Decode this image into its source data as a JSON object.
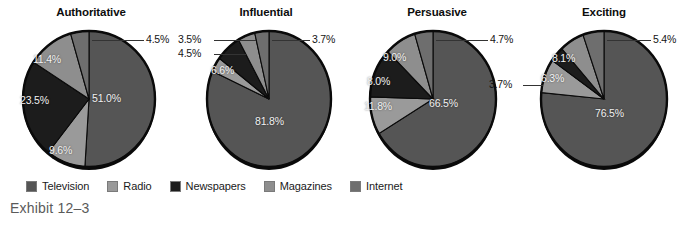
{
  "exhibit": {
    "caption": "Exhibit 12–3"
  },
  "legend": {
    "position": "bottom-left",
    "items": [
      {
        "label": "Television",
        "color": "#555555",
        "key": "television"
      },
      {
        "label": "Radio",
        "color": "#9a9a9a",
        "key": "radio"
      },
      {
        "label": "Newspapers",
        "color": "#1c1c1c",
        "key": "newspapers"
      },
      {
        "label": "Magazines",
        "color": "#8e8e8e",
        "key": "magazines"
      },
      {
        "label": "Internet",
        "color": "#6e6e6e",
        "key": "internet"
      }
    ]
  },
  "chart_data": [
    {
      "type": "pie",
      "title": "Authoritative",
      "categories": [
        "Television",
        "Radio",
        "Newspapers",
        "Magazines",
        "Internet"
      ],
      "values": [
        51.0,
        9.6,
        23.5,
        11.4,
        4.5
      ],
      "labels": [
        "51.0%",
        "9.6%",
        "23.5%",
        "11.4%",
        "4.5%"
      ],
      "colors": [
        "#555555",
        "#9a9a9a",
        "#1c1c1c",
        "#8e8e8e",
        "#6e6e6e"
      ],
      "label_placement": [
        "inside",
        "inside",
        "inside",
        "inside",
        "outside"
      ],
      "xlabel": "",
      "ylabel": "",
      "legend": "shared-bottom"
    },
    {
      "type": "pie",
      "title": "Influential",
      "categories": [
        "Television",
        "Radio",
        "Newspapers",
        "Magazines",
        "Internet"
      ],
      "values": [
        81.8,
        3.5,
        6.6,
        4.5,
        3.7
      ],
      "labels": [
        "81.8%",
        "3.5%",
        "6.6%",
        "4.5%",
        "3.7%"
      ],
      "colors": [
        "#555555",
        "#9a9a9a",
        "#1c1c1c",
        "#8e8e8e",
        "#6e6e6e"
      ],
      "label_placement": [
        "inside",
        "outside",
        "inside",
        "outside",
        "outside"
      ],
      "xlabel": "",
      "ylabel": "",
      "legend": "shared-bottom"
    },
    {
      "type": "pie",
      "title": "Persuasive",
      "categories": [
        "Television",
        "Radio",
        "Newspapers",
        "Magazines",
        "Internet"
      ],
      "values": [
        66.5,
        9.0,
        11.8,
        8.0,
        4.7
      ],
      "labels": [
        "66.5%",
        "9.0%",
        "11.8%",
        "8.0%",
        "4.7%"
      ],
      "colors": [
        "#555555",
        "#9a9a9a",
        "#1c1c1c",
        "#8e8e8e",
        "#6e6e6e"
      ],
      "label_placement": [
        "inside",
        "inside",
        "inside",
        "inside",
        "outside"
      ],
      "xlabel": "",
      "ylabel": "",
      "legend": "shared-bottom"
    },
    {
      "type": "pie",
      "title": "Exciting",
      "categories": [
        "Television",
        "Radio",
        "Newspapers",
        "Magazines",
        "Internet"
      ],
      "values": [
        76.5,
        8.1,
        3.7,
        6.3,
        5.4
      ],
      "labels": [
        "76.5%",
        "8.1%",
        "3.7%",
        "6.3%",
        "5.4%"
      ],
      "colors": [
        "#555555",
        "#9a9a9a",
        "#1c1c1c",
        "#8e8e8e",
        "#6e6e6e"
      ],
      "label_placement": [
        "inside",
        "inside",
        "outside",
        "inside",
        "outside"
      ],
      "xlabel": "",
      "ylabel": "",
      "legend": "shared-bottom"
    }
  ],
  "charts": {
    "c0": {
      "title": "Authoritative",
      "callouts": [
        {
          "text": "4.5%",
          "name": "callout-internet"
        }
      ],
      "inner": [
        {
          "text": "51.0%",
          "name": "slice-label-television"
        },
        {
          "text": "9.6%",
          "name": "slice-label-radio"
        },
        {
          "text": "23.5%",
          "name": "slice-label-newspapers"
        },
        {
          "text": "11.4%",
          "name": "slice-label-magazines"
        }
      ]
    },
    "c1": {
      "title": "Influential",
      "callouts": [
        {
          "text": "3.7%",
          "name": "callout-internet"
        },
        {
          "text": "3.5%",
          "name": "callout-radio"
        },
        {
          "text": "4.5%",
          "name": "callout-magazines"
        }
      ],
      "inner": [
        {
          "text": "81.8%",
          "name": "slice-label-television"
        },
        {
          "text": "6.6%",
          "name": "slice-label-newspapers"
        }
      ]
    },
    "c2": {
      "title": "Persuasive",
      "callouts": [
        {
          "text": "4.7%",
          "name": "callout-internet"
        }
      ],
      "inner": [
        {
          "text": "66.5%",
          "name": "slice-label-television"
        },
        {
          "text": "9.0%",
          "name": "slice-label-radio"
        },
        {
          "text": "8.0%",
          "name": "slice-label-magazines"
        },
        {
          "text": "11.8%",
          "name": "slice-label-newspapers"
        }
      ]
    },
    "c3": {
      "title": "Exciting",
      "callouts": [
        {
          "text": "5.4%",
          "name": "callout-internet"
        },
        {
          "text": "3.7%",
          "name": "callout-newspapers"
        }
      ],
      "inner": [
        {
          "text": "76.5%",
          "name": "slice-label-television"
        },
        {
          "text": "8.1%",
          "name": "slice-label-radio"
        },
        {
          "text": "6.3%",
          "name": "slice-label-magazines"
        }
      ]
    }
  }
}
